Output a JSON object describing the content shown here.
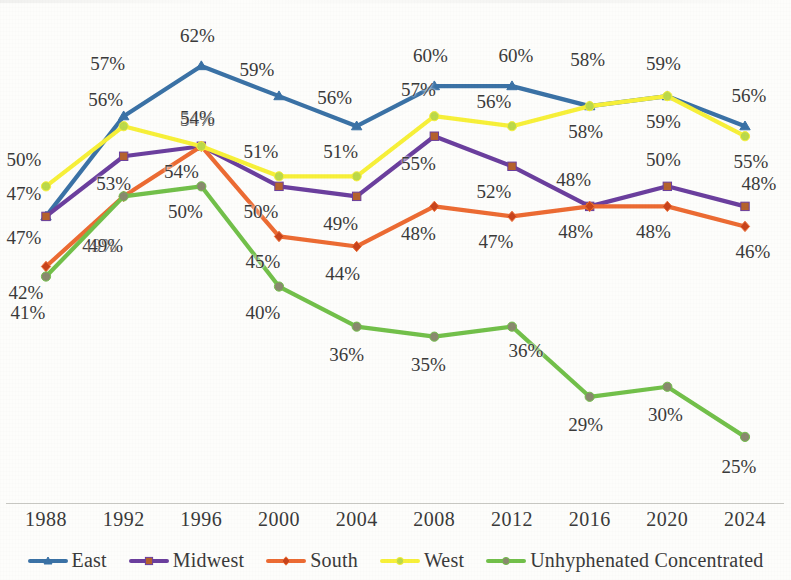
{
  "chart_data": {
    "type": "line",
    "title": "",
    "xlabel": "",
    "ylabel": "",
    "grid": false,
    "legend_position": "bottom",
    "value_labels": true,
    "value_label_suffix": "%",
    "ylim": [
      20,
      65
    ],
    "categories": [
      "1988",
      "1992",
      "1996",
      "2000",
      "2004",
      "2008",
      "2012",
      "2016",
      "2020",
      "2024"
    ],
    "series": [
      {
        "name": "East",
        "color": "#3b72a6",
        "marker": "triangle",
        "marker_color": "#3b72a6",
        "values": [
          47,
          57,
          62,
          59,
          56,
          60,
          60,
          58,
          59,
          56
        ],
        "labels": [
          "47%",
          "57%",
          "62%",
          "59%",
          "56%",
          "60%",
          "60%",
          "58%",
          "59%",
          "56%"
        ]
      },
      {
        "name": "Midwest",
        "color": "#6b3f9e",
        "marker": "square",
        "marker_color": "#b5622e",
        "values": [
          47,
          53,
          54,
          50,
          49,
          55,
          52,
          48,
          50,
          48
        ],
        "labels": [
          "47%",
          "53%",
          "54%",
          "50%",
          "49%",
          "55%",
          "52%",
          "48%",
          "50%",
          "48%"
        ]
      },
      {
        "name": "South",
        "color": "#ec6b33",
        "marker": "diamond",
        "marker_color": "#c8441c",
        "values": [
          42,
          49,
          54,
          45,
          44,
          48,
          47,
          48,
          48,
          46
        ],
        "labels": [
          "42%",
          "49%",
          "54%",
          "45%",
          "44%",
          "48%",
          "47%",
          "48%",
          "48%",
          "46%"
        ]
      },
      {
        "name": "West",
        "color": "#f7f039",
        "marker": "circle",
        "marker_color": "#bcd94a",
        "values": [
          50,
          56,
          54,
          51,
          51,
          57,
          56,
          58,
          59,
          55
        ],
        "labels": [
          "50%",
          "56%",
          "54%",
          "51%",
          "51%",
          "57%",
          "56%",
          "58%",
          "59%",
          "55%"
        ]
      },
      {
        "name": "Unhyphenated Concentrated",
        "color": "#72c04a",
        "marker": "circle",
        "marker_color": "#8a8a6e",
        "values": [
          41,
          49,
          50,
          40,
          36,
          35,
          36,
          29,
          30,
          25
        ],
        "labels": [
          "41%",
          "49%",
          "50%",
          "40%",
          "36%",
          "35%",
          "36%",
          "29%",
          "30%",
          "25%"
        ]
      }
    ]
  },
  "axis": {
    "tick_labels": [
      "1988",
      "1992",
      "1996",
      "2000",
      "2004",
      "2008",
      "2012",
      "2016",
      "2020",
      "2024"
    ]
  },
  "legend": {
    "items": [
      {
        "label": "East",
        "color": "#3b72a6",
        "marker_color": "#3b72a6"
      },
      {
        "label": "Midwest",
        "color": "#6b3f9e",
        "marker_color": "#b5622e"
      },
      {
        "label": "South",
        "color": "#ec6b33",
        "marker_color": "#c8441c"
      },
      {
        "label": "West",
        "color": "#f7f039",
        "marker_color": "#bcd94a"
      },
      {
        "label": "Unhyphenated Concentrated",
        "color": "#72c04a",
        "marker_color": "#8a8a6e"
      }
    ]
  }
}
